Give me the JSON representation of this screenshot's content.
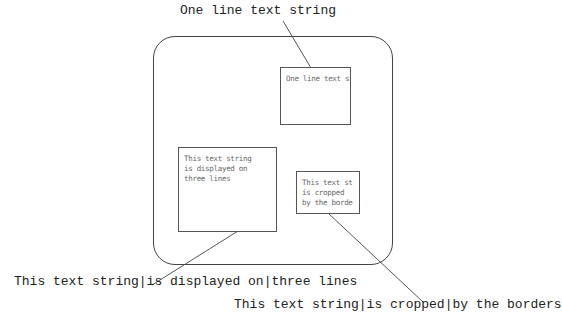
{
  "labels": {
    "top": "One line text string",
    "bottom_left": "This text string|is displayed on|three lines",
    "bottom_right": "This text string|is cropped|by the borders"
  },
  "boxes": {
    "one_line": {
      "lines": "One line text string"
    },
    "three_lines": {
      "lines": "This text string\nis displayed on\nthree lines"
    },
    "cropped": {
      "lines": "This text st\nis cropped\nby the borde"
    }
  }
}
